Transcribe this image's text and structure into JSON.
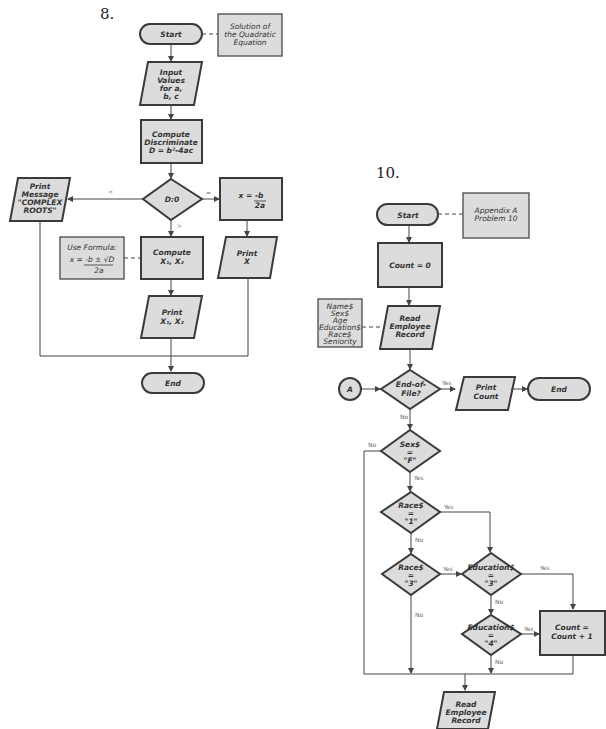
{
  "figure8": {
    "number": "8.",
    "start": "Start",
    "annotation": [
      "Solution of",
      "the Quadratic",
      "Equation"
    ],
    "input": [
      "Input",
      "Values",
      "for a,",
      "b, c"
    ],
    "compute_disc": [
      "Compute",
      "Discriminate",
      "D = b²-4ac"
    ],
    "decision": "D:0",
    "branch_lt": "<",
    "branch_eq": "=",
    "branch_gt": ">",
    "print_complex": [
      "Print",
      "Message",
      "\"COMPLEX",
      "ROOTS\""
    ],
    "single_root": [
      "x = -b",
      "2a"
    ],
    "print_x": [
      "Print",
      "X"
    ],
    "formula_note": [
      "Use Formula:",
      "x = -b ± √D",
      "2a"
    ],
    "compute_roots": [
      "Compute",
      "X₁, X₂"
    ],
    "print_roots": [
      "Print",
      "X₁, X₂"
    ],
    "end": "End"
  },
  "figure10": {
    "number": "10.",
    "start": "Start",
    "annotation": [
      "Appendix A",
      "Problem 10"
    ],
    "init": "Count = 0",
    "fields_note": [
      "Name$",
      "Sex$",
      "Age",
      "Education$",
      "Race$",
      "Seniority"
    ],
    "read1": [
      "Read",
      "Employee",
      "Record"
    ],
    "connector": "A",
    "eof": [
      "End-of-",
      "File?"
    ],
    "print_count": [
      "Print",
      "Count"
    ],
    "end": "End",
    "sex": [
      "Sex$",
      "=",
      "\"F\""
    ],
    "race1": [
      "Race$",
      "=",
      "\"1\""
    ],
    "race3": [
      "Race$",
      "=",
      "\"3\""
    ],
    "edu3": [
      "Education$",
      "=",
      "\"3\""
    ],
    "edu4": [
      "Education$",
      "=",
      "\"4\""
    ],
    "increment": [
      "Count =",
      "Count + 1"
    ],
    "read2": [
      "Read",
      "Employee",
      "Record"
    ],
    "yes": "Yes",
    "no": "No"
  }
}
